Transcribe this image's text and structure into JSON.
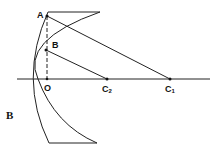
{
  "figure": {
    "panel_label": "B",
    "points": {
      "A": {
        "label": "A"
      },
      "B": {
        "label": "B"
      },
      "O": {
        "label": "O"
      },
      "C2": {
        "label": "C",
        "sub": "2"
      },
      "C1": {
        "label": "C",
        "sub": "1"
      }
    }
  }
}
